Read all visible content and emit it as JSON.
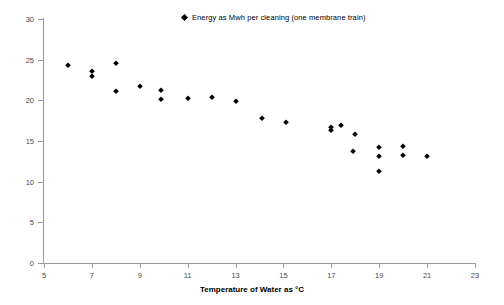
{
  "chart_data": {
    "type": "scatter",
    "title": "",
    "xlabel": "Temperature of Water as °C",
    "ylabel": "",
    "xlim": [
      5,
      23
    ],
    "ylim": [
      0,
      30
    ],
    "xticks": [
      5,
      7,
      9,
      11,
      13,
      15,
      17,
      19,
      21,
      23
    ],
    "yticks": [
      0,
      5,
      10,
      15,
      20,
      25,
      30
    ],
    "grid": false,
    "legend_position": "top-center",
    "marker": "diamond",
    "marker_color": "#000000",
    "series": [
      {
        "name": "Energy as Mwh per cleaning (one membrane train)",
        "points": [
          [
            6.0,
            24.2
          ],
          [
            7.0,
            23.5
          ],
          [
            7.0,
            22.9
          ],
          [
            8.0,
            24.5
          ],
          [
            8.0,
            21.0
          ],
          [
            9.0,
            21.7
          ],
          [
            9.9,
            21.2
          ],
          [
            9.9,
            20.0
          ],
          [
            11.0,
            20.2
          ],
          [
            12.0,
            20.3
          ],
          [
            13.0,
            19.8
          ],
          [
            14.1,
            17.7
          ],
          [
            15.1,
            17.2
          ],
          [
            17.0,
            16.6
          ],
          [
            17.0,
            16.2
          ],
          [
            17.4,
            16.8
          ],
          [
            18.0,
            15.7
          ],
          [
            17.9,
            13.6
          ],
          [
            19.0,
            14.1
          ],
          [
            19.0,
            13.0
          ],
          [
            19.0,
            11.2
          ],
          [
            20.0,
            14.3
          ],
          [
            20.0,
            13.2
          ],
          [
            21.0,
            13.0
          ]
        ]
      }
    ]
  },
  "legend": {
    "label": "Energy as Mwh per cleaning (one membrane train)",
    "marker_name": "diamond-marker"
  },
  "axes": {
    "x_title": "Temperature of Water as °C",
    "x_labels": [
      "5",
      "7",
      "9",
      "11",
      "13",
      "15",
      "17",
      "19",
      "21",
      "23"
    ],
    "y_labels": [
      "0",
      "5",
      "10",
      "15",
      "20",
      "25",
      "30"
    ]
  },
  "colors": {
    "marker": "#000000",
    "axis": "#9a9a9a",
    "tick_text": "#4a4a4a",
    "background": "#ffffff"
  }
}
